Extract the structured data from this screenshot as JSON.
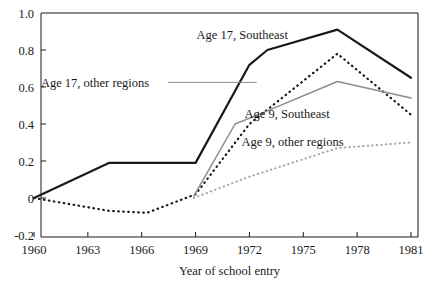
{
  "chart_data": {
    "type": "line",
    "title": "",
    "xlabel": "Year of school entry",
    "ylabel": "",
    "xlim": [
      1959.2,
      1981.6
    ],
    "ylim": [
      -0.2,
      1.0
    ],
    "xticks": [
      "1960",
      "1963",
      "1966",
      "1969",
      "1972",
      "1975",
      "1978",
      "1981"
    ],
    "xtick_values": [
      1960,
      1963,
      1966,
      1969,
      1972,
      1975,
      1978,
      1981
    ],
    "yticks": [
      "1.0",
      "0.8",
      "0.6",
      "0.4",
      "0.2",
      "0",
      "-0.2"
    ],
    "ytick_values": [
      1.0,
      0.8,
      0.6,
      0.4,
      0.2,
      0,
      -0.2
    ],
    "grid": false,
    "legend_position": "inline-annotations",
    "series": [
      {
        "name": "Age 17, Southeast",
        "style": "solid",
        "color": "#1a1a1a",
        "width": 2.2,
        "label_x": 1971.6,
        "label_y": 0.885,
        "leader": false,
        "x": [
          1960,
          1964.2,
          1969,
          1972,
          1973,
          1976.9,
          1981
        ],
        "y": [
          0.0,
          0.19,
          0.19,
          0.72,
          0.8,
          0.91,
          0.65
        ]
      },
      {
        "name": "Age 17, other regions",
        "style": "dotted",
        "color": "#1a1a1a",
        "width": 2.2,
        "label_x": 1963.4,
        "label_y": 0.625,
        "leader": true,
        "leader_to_x": 1972.4,
        "x": [
          1960,
          1964.2,
          1966.3,
          1969,
          1972,
          1976.9,
          1981
        ],
        "y": [
          0.0,
          -0.07,
          -0.08,
          0.02,
          0.4,
          0.78,
          0.45
        ]
      },
      {
        "name": "Age 9, Southeast",
        "style": "solid",
        "color": "#8c8c8c",
        "width": 1.5,
        "label_x": 1974.1,
        "label_y": 0.455,
        "leader": false,
        "x": [
          1968.9,
          1971.2,
          1972.6,
          1976.9,
          1981
        ],
        "y": [
          0.01,
          0.4,
          0.455,
          0.63,
          0.54
        ]
      },
      {
        "name": "Age 9, other regions",
        "style": "dotted",
        "color": "#a8a8a8",
        "width": 2.0,
        "label_x": 1974.4,
        "label_y": 0.305,
        "leader": false,
        "x": [
          1968.9,
          1972,
          1976.9,
          1981
        ],
        "y": [
          0.0,
          0.115,
          0.27,
          0.3
        ]
      }
    ]
  }
}
